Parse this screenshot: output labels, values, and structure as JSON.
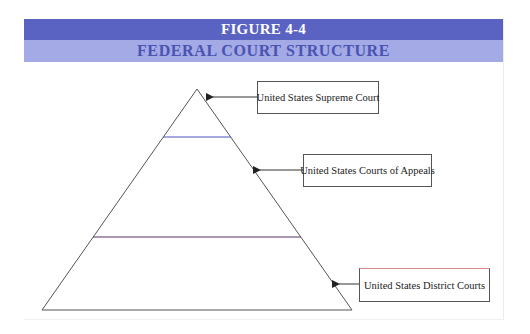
{
  "figure": {
    "number_label": "FIGURE 4-4",
    "title": "FEDERAL COURT STRUCTURE"
  },
  "colors": {
    "title_band": "#5a63c2",
    "subtitle_band": "#a3aae6",
    "subtitle_text": "#4a53b0",
    "upper_divider": "#5050c0",
    "lower_divider": "#553366"
  },
  "pyramid": {
    "tiers": [
      {
        "name": "United States Supreme Court",
        "level": "top"
      },
      {
        "name": "United States Courts of Appeals",
        "level": "middle"
      },
      {
        "name": "United States District Courts",
        "level": "bottom"
      }
    ]
  },
  "labels": {
    "supreme": "United States Supreme Court",
    "appeals": "United States Courts of Appeals",
    "district": "United States District Courts"
  }
}
